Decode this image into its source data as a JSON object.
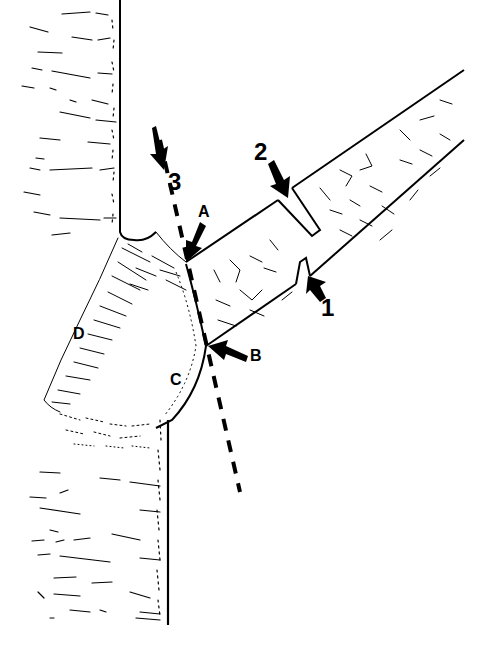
{
  "diagram": {
    "labels": {
      "cut_1": "1",
      "cut_2": "2",
      "cut_3": "3",
      "point_a": "A",
      "point_b": "B",
      "region_c": "C",
      "region_d": "D"
    },
    "colors": {
      "ink": "#000000",
      "paper": "#ffffff",
      "caption": "#e6e6e6"
    },
    "elements": [
      {
        "id": "trunk",
        "description": "Vertical tree trunk on left with bark texture"
      },
      {
        "id": "branch",
        "description": "Diagonal branch extending up-right from trunk"
      },
      {
        "id": "cut-1",
        "description": "Undercut notch on underside of branch, arrow 1"
      },
      {
        "id": "cut-2",
        "description": "Top cut severing branch, arrow 2"
      },
      {
        "id": "cut-3",
        "description": "Dashed final cut line from A to B, arrow 3"
      },
      {
        "id": "point-a",
        "description": "Branch bark ridge point"
      },
      {
        "id": "point-b",
        "description": "Outer edge of branch collar"
      },
      {
        "id": "region-c",
        "description": "Branch collar"
      },
      {
        "id": "region-d",
        "description": "Branch bark ridge / trunk collar tissue"
      }
    ]
  }
}
